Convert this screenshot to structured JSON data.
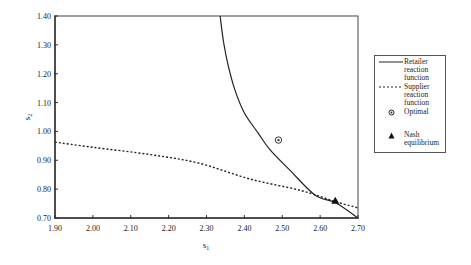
{
  "chart_data": {
    "type": "line",
    "title": "",
    "xlabel": "s1",
    "ylabel": "s2",
    "xlim": [
      1.9,
      2.7
    ],
    "ylim": [
      0.7,
      1.4
    ],
    "xticks": [
      "1.90",
      "2.00",
      "2.10",
      "2.20",
      "2.30",
      "2.40",
      "2.50",
      "2.60",
      "2.70"
    ],
    "yticks": [
      "0.70",
      "0.80",
      "0.90",
      "1.00",
      "1.10",
      "1.20",
      "1.30",
      "1.40"
    ],
    "grid": false,
    "legend_position": "right",
    "series": [
      {
        "name": "Retailer reaction function",
        "style": "solid",
        "x": [
          2.336,
          2.345,
          2.357,
          2.375,
          2.4,
          2.436,
          2.468,
          2.52,
          2.586,
          2.642,
          2.7
        ],
        "y": [
          1.4,
          1.31,
          1.23,
          1.144,
          1.064,
          0.995,
          0.936,
          0.866,
          0.78,
          0.752,
          0.7
        ]
      },
      {
        "name": "Supplier reaction function",
        "style": "dotted",
        "x": [
          1.9,
          2.0,
          2.15,
          2.28,
          2.415,
          2.55,
          2.642,
          2.7
        ],
        "y": [
          0.963,
          0.945,
          0.92,
          0.89,
          0.835,
          0.795,
          0.756,
          0.735
        ]
      },
      {
        "name": "Optimal",
        "style": "marker-circle",
        "x": [
          2.49
        ],
        "y": [
          0.97
        ]
      },
      {
        "name": "Nash equilibrium",
        "style": "marker-triangle",
        "x": [
          2.64
        ],
        "y": [
          0.76
        ]
      }
    ]
  },
  "legend": {
    "items": [
      {
        "label_lines": [
          "Retailer",
          "reaction",
          "function"
        ]
      },
      {
        "label_lines": [
          "Supplier",
          "reaction",
          "function"
        ]
      },
      {
        "label_lines": [
          "Optimal"
        ]
      },
      {
        "label_lines": [
          "Nash",
          "equilibrium"
        ]
      }
    ]
  },
  "labels": {
    "x_main": "s",
    "x_sub": "1",
    "y_main": "s",
    "y_sub": "2"
  }
}
